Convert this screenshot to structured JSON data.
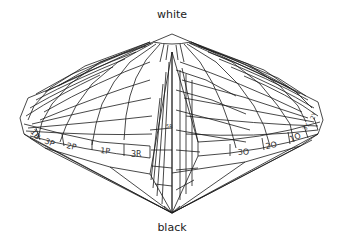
{
  "diagram": {
    "top_pole": "white",
    "bottom_pole": "black",
    "rim_labels_left": [
      "1B",
      "3P",
      "2P",
      "1P",
      "3R"
    ],
    "rim_labels_right": [
      "3O",
      "2O",
      "1O",
      "3Y",
      "2Y"
    ],
    "center_label": "5R",
    "colors": {
      "line": "#1a1a1a",
      "background": "#ffffff",
      "text": "#333333"
    }
  }
}
